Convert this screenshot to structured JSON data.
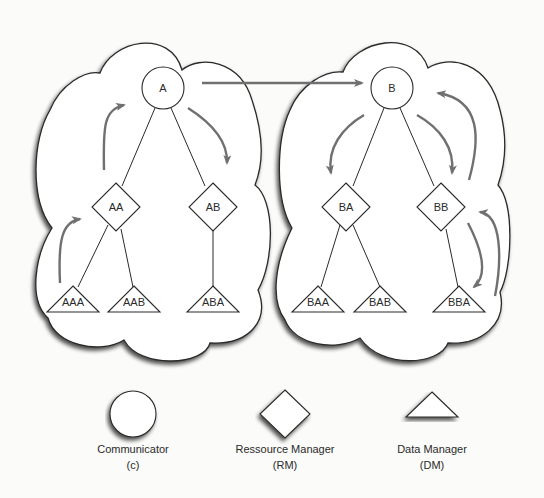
{
  "figure": {
    "colors": {
      "background": "#fbfbf9",
      "stroke": "#2a2a2a",
      "arrow": "#707070",
      "shadow": "#555555"
    },
    "clusters": [
      {
        "name": "left-cloud",
        "root": "A",
        "resource_managers": [
          "AA",
          "AB"
        ],
        "data_managers": [
          "AAA",
          "AAB",
          "ABA"
        ]
      },
      {
        "name": "right-cloud",
        "root": "B",
        "resource_managers": [
          "BA",
          "BB"
        ],
        "data_managers": [
          "BAA",
          "BAB",
          "BBA"
        ]
      }
    ],
    "nodes": {
      "A": "A",
      "B": "B",
      "AA": "AA",
      "AB": "AB",
      "BA": "BA",
      "BB": "BB",
      "AAA": "AAA",
      "AAB": "AAB",
      "ABA": "ABA",
      "BAA": "BAA",
      "BAB": "BAB",
      "BBA": "BBA"
    },
    "edges": [
      [
        "A",
        "AA"
      ],
      [
        "A",
        "AB"
      ],
      [
        "AA",
        "AAA"
      ],
      [
        "AA",
        "AAB"
      ],
      [
        "AB",
        "ABA"
      ],
      [
        "B",
        "BA"
      ],
      [
        "B",
        "BB"
      ],
      [
        "BA",
        "BAA"
      ],
      [
        "BA",
        "BAB"
      ],
      [
        "BB",
        "BBA"
      ]
    ],
    "message_arrows": [
      [
        "AAA",
        "AA"
      ],
      [
        "AA",
        "A"
      ],
      [
        "A",
        "AB"
      ],
      [
        "A",
        "B"
      ],
      [
        "B",
        "BA"
      ],
      [
        "B",
        "BB"
      ],
      [
        "BB",
        "BBA"
      ],
      [
        "BBA",
        "BB"
      ],
      [
        "BB",
        "B"
      ]
    ]
  },
  "legend": [
    {
      "shape": "circle",
      "line1": "Communicator",
      "line2": "(c)"
    },
    {
      "shape": "diamond",
      "line1": "Ressource Manager",
      "line2": "(RM)"
    },
    {
      "shape": "triangle",
      "line1": "Data Manager",
      "line2": "(DM)"
    }
  ]
}
